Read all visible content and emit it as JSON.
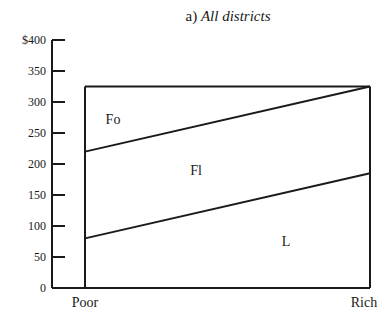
{
  "chart_data": {
    "type": "area",
    "title": "a) All districts",
    "title_prefix": "a)",
    "title_main": "All districts",
    "xlabel": "",
    "ylabel": "",
    "x_categories": [
      "Poor",
      "Rich"
    ],
    "y_ticks": [
      "$400",
      "350",
      "300",
      "250",
      "200",
      "150",
      "100",
      "50",
      "0"
    ],
    "y_tick_values": [
      400,
      350,
      300,
      250,
      200,
      150,
      100,
      50,
      0
    ],
    "ylim": [
      0,
      400
    ],
    "grid": false,
    "legend": "inline region labels",
    "total": {
      "Poor": 325,
      "Rich": 325
    },
    "boundaries": [
      {
        "name": "L/Fl boundary",
        "values": {
          "Poor": 80,
          "Rich": 185
        }
      },
      {
        "name": "Fl/Fo boundary",
        "values": {
          "Poor": 220,
          "Rich": 325
        }
      }
    ],
    "series": [
      {
        "name": "L",
        "values": [
          80,
          185
        ]
      },
      {
        "name": "Fl",
        "values": [
          140,
          140
        ]
      },
      {
        "name": "Fo",
        "values": [
          105,
          0
        ]
      }
    ],
    "region_labels": [
      "Fo",
      "Fl",
      "L"
    ]
  }
}
